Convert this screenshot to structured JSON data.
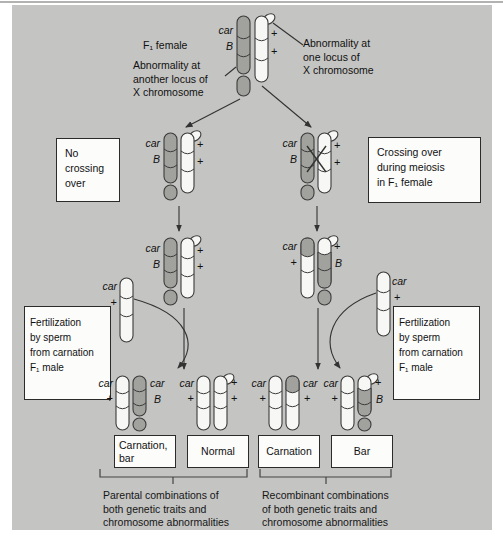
{
  "colors": {
    "diagram_bg": "#c4c4c2",
    "chromosome_shaded": "#a1a19d",
    "chromosome_white": "#f7f7f5",
    "outline": "#3b3b3b",
    "line": "#333333"
  },
  "labels": {
    "f1_female": "F₁ female",
    "abnormality_left": "Abnormality at\nanother locus of\nX chromosome",
    "abnormality_right": "Abnormality at\none locus of\nX chromosome"
  },
  "alleles": {
    "car": "car",
    "B": "B",
    "plus": "+"
  },
  "boxes": {
    "no_crossing_over": "No\ncrossing\nover",
    "crossing_over": "Crossing over\nduring meiosis\nin F₁ female",
    "fertilization_left": "Fertilization\nby sperm\nfrom carnation\nF₁ male",
    "fertilization_right": "Fertilization\nby sperm\nfrom carnation\nF₁ male",
    "outcome_1": "Carnation,\nbar",
    "outcome_2": "Normal",
    "outcome_3": "Carnation",
    "outcome_4": "Bar"
  },
  "footer": {
    "parental": "Parental combinations of\nboth genetic traits and\nchromosome abnormalities",
    "recombinant": "Recombinant combinations\nof both genetic traits and\nchromosome abnormalities"
  }
}
